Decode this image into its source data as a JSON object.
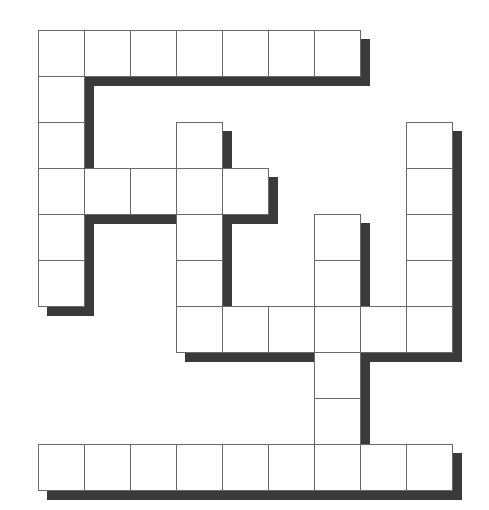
{
  "puzzle": {
    "type": "crossword-grid",
    "origin": {
      "x": 38,
      "y": 30
    },
    "cell_size": 46,
    "shadow_offset": 9,
    "colors": {
      "cell_fill": "#ffffff",
      "cell_border": "#6a6a6a",
      "shadow": "#3a3a3a"
    },
    "cells": [
      [
        0,
        0
      ],
      [
        0,
        1
      ],
      [
        0,
        2
      ],
      [
        0,
        3
      ],
      [
        0,
        4
      ],
      [
        0,
        5
      ],
      [
        0,
        6
      ],
      [
        1,
        0
      ],
      [
        2,
        0
      ],
      [
        2,
        3
      ],
      [
        2,
        8
      ],
      [
        3,
        0
      ],
      [
        3,
        1
      ],
      [
        3,
        2
      ],
      [
        3,
        3
      ],
      [
        3,
        4
      ],
      [
        3,
        8
      ],
      [
        4,
        0
      ],
      [
        4,
        3
      ],
      [
        4,
        6
      ],
      [
        4,
        8
      ],
      [
        5,
        0
      ],
      [
        5,
        3
      ],
      [
        5,
        6
      ],
      [
        5,
        8
      ],
      [
        6,
        3
      ],
      [
        6,
        4
      ],
      [
        6,
        5
      ],
      [
        6,
        6
      ],
      [
        6,
        7
      ],
      [
        6,
        8
      ],
      [
        7,
        6
      ],
      [
        8,
        6
      ],
      [
        9,
        0
      ],
      [
        9,
        1
      ],
      [
        9,
        2
      ],
      [
        9,
        3
      ],
      [
        9,
        4
      ],
      [
        9,
        5
      ],
      [
        9,
        6
      ],
      [
        9,
        7
      ],
      [
        9,
        8
      ]
    ]
  }
}
